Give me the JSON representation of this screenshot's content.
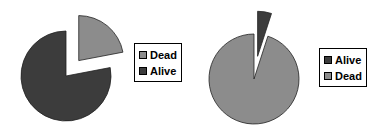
{
  "chart_data": [
    {
      "type": "pie",
      "title": "",
      "categories": [
        "Dead",
        "Alive"
      ],
      "values": [
        22,
        78
      ],
      "colors": {
        "Dead": "#8c8c8c",
        "Alive": "#3c3c3c"
      },
      "exploded": [
        "Dead"
      ],
      "legend": {
        "position": "right",
        "entries": [
          "Dead",
          "Alive"
        ]
      }
    },
    {
      "type": "pie",
      "title": "",
      "categories": [
        "Alive",
        "Dead"
      ],
      "values": [
        5,
        95
      ],
      "colors": {
        "Alive": "#3c3c3c",
        "Dead": "#8c8c8c"
      },
      "exploded": [
        "Alive"
      ],
      "legend": {
        "position": "right",
        "entries": [
          "Alive",
          "Dead"
        ]
      }
    }
  ],
  "legends": {
    "left": [
      {
        "label": "Dead",
        "color": "#8c8c8c"
      },
      {
        "label": "Alive",
        "color": "#3c3c3c"
      }
    ],
    "right": [
      {
        "label": "Alive",
        "color": "#3c3c3c"
      },
      {
        "label": "Dead",
        "color": "#8c8c8c"
      }
    ]
  }
}
